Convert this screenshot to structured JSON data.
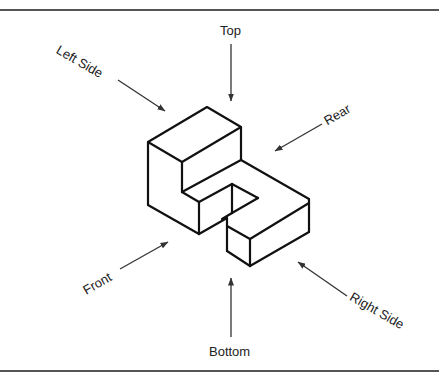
{
  "figure": {
    "border_color": "#555555",
    "line_color": "#111111",
    "arrow_color": "#333333"
  },
  "views": {
    "top": "Top",
    "bottom": "Bottom",
    "front": "Front",
    "rear": "Rear",
    "left_side": "Left Side",
    "right_side": "Right Side"
  }
}
